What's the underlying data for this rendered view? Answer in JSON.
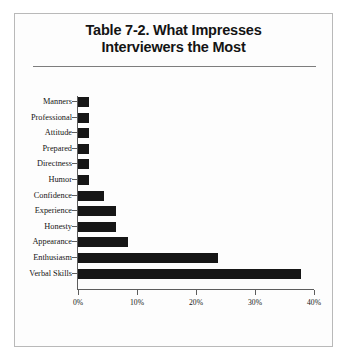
{
  "figure": {
    "title_lines": [
      "Table 7-2. What Impresses",
      "Interviewers the Most"
    ]
  },
  "chart_data": {
    "type": "bar",
    "orientation": "horizontal",
    "title": "Table 7-2. What Impresses Interviewers the Most",
    "xlabel": "",
    "ylabel": "",
    "xlim": [
      0,
      40
    ],
    "xticks": [
      0,
      10,
      20,
      30,
      40
    ],
    "xtick_labels": [
      "0%",
      "10%",
      "20%",
      "30%",
      "40%"
    ],
    "grid": false,
    "legend": false,
    "bar_color": "#161616",
    "categories": [
      "Manners",
      "Professional",
      "Attitude",
      "Prepared",
      "Directness",
      "Humor",
      "Confidence",
      "Experience",
      "Honesty",
      "Appearance",
      "Enthusiasm",
      "Verbal Skills"
    ],
    "values": [
      1.8,
      1.8,
      1.8,
      1.8,
      1.8,
      1.8,
      4.4,
      6.4,
      6.4,
      8.4,
      23.8,
      37.8
    ],
    "value_unit": "%"
  }
}
